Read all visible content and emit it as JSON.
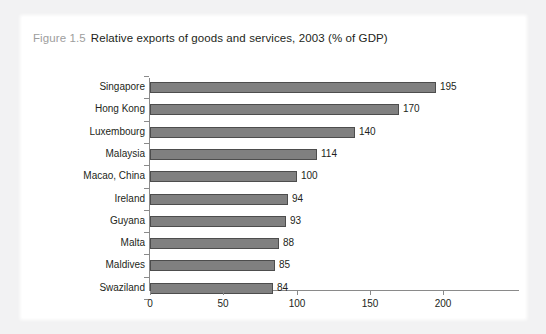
{
  "figure": {
    "number": "Figure 1.5",
    "caption": "Relative exports of goods and services, 2003 (% of GDP)"
  },
  "chart_data": {
    "type": "bar",
    "orientation": "horizontal",
    "xlabel": "",
    "ylabel": "",
    "categories": [
      "Singapore",
      "Hong Kong",
      "Luxembourg",
      "Malaysia",
      "Macao, China",
      "Ireland",
      "Guyana",
      "Malta",
      "Maldives",
      "Swaziland"
    ],
    "values": [
      195,
      170,
      140,
      114,
      100,
      94,
      93,
      88,
      85,
      84
    ],
    "value_labels": [
      "195",
      "170",
      "140",
      "114",
      "100",
      "94",
      "93",
      "88",
      "85",
      "84"
    ],
    "xlim": [
      0,
      200
    ],
    "xticks": [
      0,
      50,
      100,
      150,
      200
    ],
    "xtick_labels": [
      "0",
      "50",
      "100",
      "150",
      "200"
    ],
    "grid": false,
    "legend": null,
    "bar_color": "#808080",
    "bar_edge_color": "#4d4d4d",
    "axis_color": "#8a8a8a",
    "text_color": "#231f20",
    "figure_number_color": "#9d9d9d",
    "panel_background": "#ffffff",
    "page_background": "#f2f2f3"
  }
}
